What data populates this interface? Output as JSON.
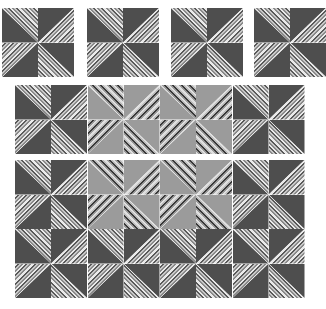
{
  "colors": {
    "dark_fabric": "#4e4e4e",
    "light_fabric": "#9b9b9b",
    "stripe_fabric": "#eaeaea",
    "background": "#ffffff"
  },
  "pinwheel_layout": {
    "tl": {
      "solid": "bl",
      "stripe": "tr",
      "stripe_dir": "s-bs"
    },
    "tr": {
      "solid": "tl",
      "stripe": "br",
      "stripe_dir": "s-fs"
    },
    "bl": {
      "solid": "br",
      "stripe": "tl",
      "stripe_dir": "s-fs"
    },
    "br": {
      "solid": "tr",
      "stripe": "bl",
      "stripe_dir": "s-bs"
    }
  },
  "sections": [
    {
      "name": "single-blocks-row",
      "x": 2,
      "y": 8,
      "blocks": [
        {
          "x": 2,
          "tone": "dark"
        },
        {
          "x": 87,
          "tone": "dark"
        },
        {
          "x": 171,
          "tone": "dark"
        },
        {
          "x": 254,
          "tone": "dark"
        }
      ]
    },
    {
      "name": "pinwheel-band",
      "x": 15,
      "y": 85,
      "rows": [
        [
          "dark",
          "light",
          "light",
          "dark"
        ]
      ]
    },
    {
      "name": "pinwheel-quilt",
      "x": 15,
      "y": 160,
      "rows": [
        [
          "dark",
          "light",
          "light",
          "dark"
        ],
        [
          "dark",
          "dark",
          "dark",
          "dark"
        ]
      ]
    }
  ]
}
